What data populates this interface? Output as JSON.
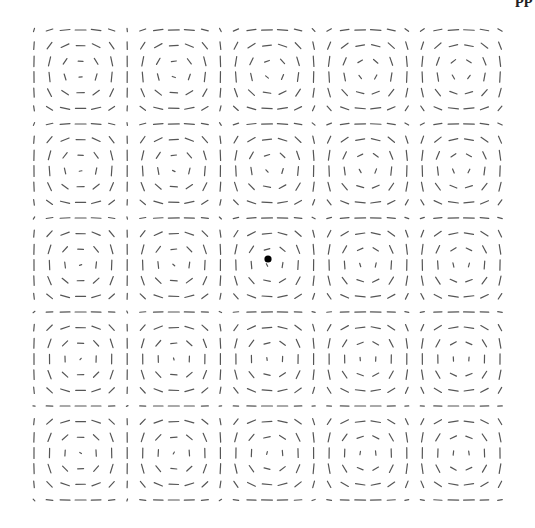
{
  "figure": {
    "glyph_color": "#555555",
    "center_marker_color": "#000000",
    "grid": {
      "columns": 31,
      "rows": 31
    },
    "field": {
      "type": "cellular-flow",
      "stream_function": "sin(kx*x)*sin(ky*y)",
      "cells_x": 5,
      "cells_y": 5
    },
    "marker": {
      "label": "center-point",
      "cell": [
        2,
        2
      ]
    }
  },
  "clipped_header_fragment": "pp"
}
